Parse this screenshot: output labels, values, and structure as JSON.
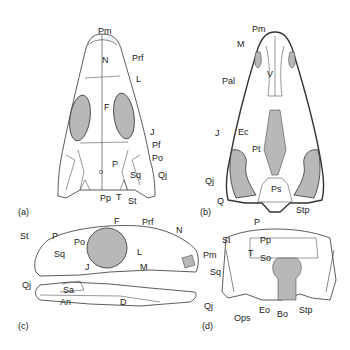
{
  "figure": {
    "fill_color": "#b8b8b8",
    "line_color": "#333333",
    "panels": [
      {
        "id": "a",
        "label": "(a)",
        "view": "dorsal",
        "bones": [
          "Pm",
          "N",
          "Prf",
          "L",
          "F",
          "J",
          "Pf",
          "Po",
          "P",
          "Sq",
          "Qj",
          "Pp",
          "T",
          "St"
        ]
      },
      {
        "id": "b",
        "label": "(b)",
        "view": "palatal",
        "bones": [
          "Pm",
          "M",
          "Pal",
          "V",
          "J",
          "Ec",
          "Pt",
          "Qj",
          "Q",
          "Ps",
          "Stp"
        ]
      },
      {
        "id": "c",
        "label": "(c)",
        "view": "lateral",
        "bones": [
          "F",
          "Prf",
          "N",
          "St",
          "P",
          "Po",
          "Sq",
          "L",
          "J",
          "M",
          "Pm",
          "Qj",
          "Sa",
          "An",
          "D"
        ]
      },
      {
        "id": "d",
        "label": "(d)",
        "view": "occipital",
        "bones": [
          "P",
          "St",
          "Pp",
          "T",
          "So",
          "Sq",
          "Qj",
          "Ops",
          "Eo",
          "Bo",
          "Stp"
        ]
      }
    ]
  },
  "labels": {
    "a": {
      "Pm": "Pm",
      "N": "N",
      "Prf": "Prf",
      "L": "L",
      "F": "F",
      "J": "J",
      "Pf": "Pf",
      "Po": "Po",
      "P": "P",
      "Sq": "Sq",
      "Qj": "Qj",
      "Pp": "Pp",
      "T": "T",
      "St": "St",
      "panel": "(a)"
    },
    "b": {
      "Pm": "Pm",
      "M": "M",
      "Pal": "Pal",
      "V": "V",
      "J": "J",
      "Ec": "Ec",
      "Pt": "Pt",
      "Qj": "Qj",
      "Q": "Q",
      "Ps": "Ps",
      "Stp": "Stp",
      "panel": "(b)"
    },
    "c": {
      "F": "F",
      "Prf": "Prf",
      "N": "N",
      "St": "St",
      "P": "P",
      "Po": "Po",
      "Sq": "Sq",
      "L": "L",
      "J": "J",
      "M": "M",
      "Pm": "Pm",
      "Qj": "Qj",
      "Sa": "Sa",
      "An": "An",
      "D": "D",
      "panel": "(c)"
    },
    "d": {
      "P": "P",
      "St": "St",
      "Pp": "Pp",
      "T": "T",
      "So": "So",
      "Sq": "Sq",
      "Qj": "Qj",
      "Ops": "Ops",
      "Eo": "Eo",
      "Bo": "Bo",
      "Stp": "Stp",
      "panel": "(d)"
    }
  }
}
